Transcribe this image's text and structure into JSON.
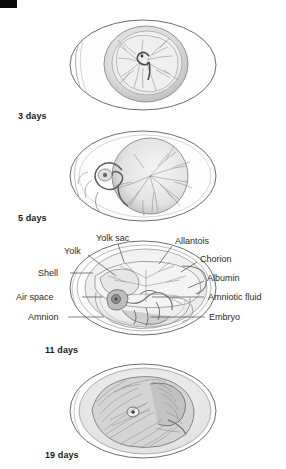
{
  "figure": {
    "title_visible": false,
    "background_color": "#ffffff",
    "line_color": "#4a4a4a",
    "corner_mark_color": "#0a0a0a"
  },
  "stages": [
    {
      "id": "stage-3-days",
      "label": "3 days",
      "label_x": 18,
      "label_y": 111,
      "egg_cx": 143,
      "egg_cy": 65,
      "egg_rx": 73,
      "egg_ry": 45
    },
    {
      "id": "stage-5-days",
      "label": "5 days",
      "label_x": 18,
      "label_y": 213,
      "egg_cx": 143,
      "egg_cy": 176,
      "egg_rx": 73,
      "egg_ry": 45
    },
    {
      "id": "stage-11-days",
      "label": "11 days",
      "label_x": 45,
      "label_y": 345,
      "egg_cx": 143,
      "egg_cy": 288,
      "egg_rx": 73,
      "egg_ry": 47
    },
    {
      "id": "stage-19-days",
      "label": "19 days",
      "label_x": 45,
      "label_y": 450,
      "egg_cx": 143,
      "egg_cy": 411,
      "egg_rx": 73,
      "egg_ry": 47
    }
  ],
  "annotations": [
    {
      "id": "yolk-sac",
      "label": "Yolk sac",
      "text_x": 96,
      "text_y": 233,
      "anchor": "left",
      "leader": [
        [
          118,
          244
        ],
        [
          124,
          262
        ]
      ]
    },
    {
      "id": "allantois",
      "label": "Allantois",
      "text_x": 175,
      "text_y": 236,
      "anchor": "left",
      "leader": [
        [
          172,
          246
        ],
        [
          159,
          264
        ]
      ]
    },
    {
      "id": "yolk",
      "label": "Yolk",
      "text_x": 64,
      "text_y": 246,
      "anchor": "left",
      "leader": [
        [
          88,
          255
        ],
        [
          116,
          276
        ]
      ]
    },
    {
      "id": "chorion",
      "label": "Chorion",
      "text_x": 200,
      "text_y": 254,
      "anchor": "left",
      "leader": [
        [
          197,
          262
        ],
        [
          181,
          272
        ]
      ]
    },
    {
      "id": "shell",
      "label": "Shell",
      "text_x": 38,
      "text_y": 268,
      "anchor": "left",
      "leader": [
        [
          70,
          273
        ],
        [
          93,
          273
        ]
      ]
    },
    {
      "id": "albumin",
      "label": "Albumin",
      "text_x": 207,
      "text_y": 273,
      "anchor": "left",
      "leader": [
        [
          204,
          281
        ],
        [
          188,
          288
        ]
      ]
    },
    {
      "id": "air-space",
      "label": "Air space",
      "text_x": 16,
      "text_y": 292,
      "anchor": "left",
      "leader": [
        [
          82,
          297
        ],
        [
          103,
          297
        ]
      ]
    },
    {
      "id": "amniotic-fluid",
      "label": "Amniotic fluid",
      "text_x": 208,
      "text_y": 292,
      "anchor": "left",
      "leader": [
        [
          204,
          297
        ],
        [
          152,
          297
        ]
      ]
    },
    {
      "id": "amnion",
      "label": "Amnion",
      "text_x": 28,
      "text_y": 312,
      "anchor": "left",
      "leader": [
        [
          68,
          317
        ],
        [
          104,
          317
        ]
      ]
    },
    {
      "id": "embryo",
      "label": "Embryo",
      "text_x": 209,
      "text_y": 312,
      "anchor": "left",
      "leader": [
        [
          205,
          317
        ],
        [
          150,
          317
        ]
      ]
    }
  ]
}
